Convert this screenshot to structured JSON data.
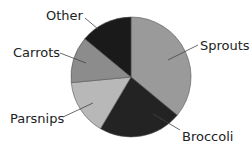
{
  "chart_data": {
    "type": "pie",
    "title": "",
    "center": [
      131,
      77
    ],
    "radius": 60,
    "start_angle_deg": 0,
    "direction": "clockwise",
    "categories": [
      "Sprouts",
      "Broccoli",
      "Parsnips",
      "Carrots",
      "Other"
    ],
    "values": [
      36,
      22.5,
      15,
      12.5,
      14
    ],
    "unit": "%",
    "slices": [
      {
        "label": "Sprouts",
        "value": 36,
        "color": "#9a9a9a"
      },
      {
        "label": "Broccoli",
        "value": 22.5,
        "color": "#232323"
      },
      {
        "label": "Parsnips",
        "value": 15,
        "color": "#b8b8b8"
      },
      {
        "label": "Carrots",
        "value": 12.5,
        "color": "#8c8c8c"
      },
      {
        "label": "Other",
        "value": 14,
        "color": "#1a1a1a"
      }
    ],
    "legend": "none (direct labels with leader lines)"
  },
  "labels": {
    "sprouts": {
      "text": "Sprouts",
      "x": 200,
      "y": 50,
      "line": [
        198,
        45,
        168,
        60
      ]
    },
    "broccoli": {
      "text": "Broccoli",
      "x": 182,
      "y": 141,
      "line": [
        180,
        130,
        153,
        114
      ]
    },
    "parsnips": {
      "text": "Parsnips",
      "x": 10,
      "y": 123,
      "line": [
        63,
        117,
        93,
        103
      ]
    },
    "carrots": {
      "text": "Carrots",
      "x": 13,
      "y": 57,
      "line": [
        60,
        53,
        86,
        63
      ]
    },
    "other": {
      "text": "Other",
      "x": 46,
      "y": 20,
      "line": [
        85,
        18,
        98,
        29
      ]
    }
  }
}
